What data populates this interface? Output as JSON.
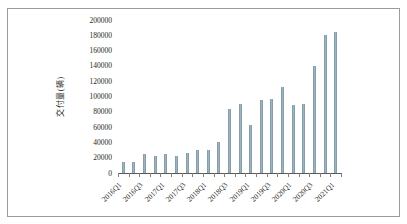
{
  "figure": {
    "background_color": "#ffffff",
    "frame_border_color": "#9b9b9b",
    "text_color": "#1f1f1f"
  },
  "chart_data": {
    "type": "bar",
    "title": "",
    "xlabel": "",
    "ylabel": "交付量(辆)",
    "ylim": [
      0,
      200000
    ],
    "yticks": [
      0,
      20000,
      40000,
      60000,
      80000,
      100000,
      120000,
      140000,
      160000,
      180000,
      200000
    ],
    "categories": [
      "2016Q1",
      "2016Q2",
      "2016Q3",
      "2016Q4",
      "2017Q1",
      "2017Q2",
      "2017Q3",
      "2017Q4",
      "2018Q1",
      "2018Q2",
      "2018Q3",
      "2018Q4",
      "2019Q1",
      "2019Q2",
      "2019Q3",
      "2019Q4",
      "2020Q1",
      "2020Q2",
      "2020Q3",
      "2020Q4",
      "2021Q1"
    ],
    "values": [
      14500,
      14400,
      24800,
      22200,
      25000,
      22000,
      26200,
      29900,
      30000,
      40700,
      83500,
      90700,
      63000,
      95200,
      97000,
      112000,
      88400,
      90700,
      139300,
      180600,
      184800
    ],
    "xtick_labels_shown": [
      "2016Q1",
      "2016Q3",
      "2017Q1",
      "2017Q3",
      "2018Q1",
      "2018Q3",
      "2019Q1",
      "2019Q3",
      "2020Q1",
      "2020Q3",
      "2021Q1"
    ],
    "xtick_label_every": 2,
    "xtick_label_rotation_deg": 45,
    "grid": false,
    "legend": null,
    "bar_color": "#9fb3bd",
    "bar_edge_color": "#71909f",
    "axis_line_color": "#595959",
    "tick_mark_color": "#7f7f7f"
  }
}
